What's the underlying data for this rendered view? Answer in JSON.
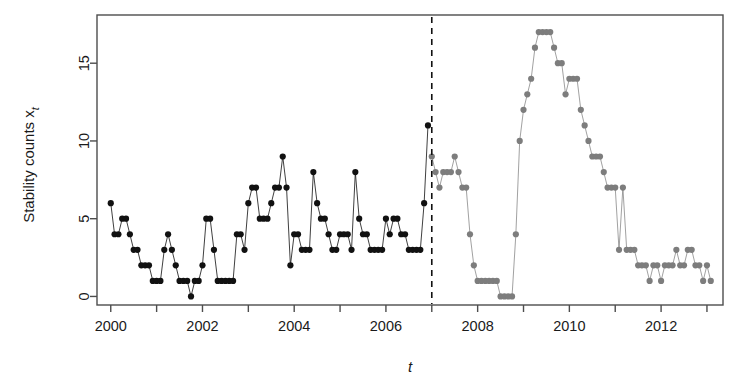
{
  "figure": {
    "background": "#ffffff",
    "frame_color": "#4d4d4d"
  },
  "axes": {
    "y_title_main": "Stability counts x",
    "y_title_sub": "t",
    "x_title": "t",
    "y_ticks": [
      0,
      5,
      10,
      15
    ],
    "x_ticks": [
      2000,
      2002,
      2004,
      2006,
      2008,
      2010,
      2012
    ],
    "x_minor_ticks": [
      2001,
      2003,
      2005,
      2007,
      2009,
      2011,
      2013
    ],
    "xlim": [
      1999.7,
      2013.35
    ],
    "ylim": [
      -0.55,
      18.1
    ]
  },
  "styles": {
    "observed_color": "#111111",
    "forecast_color": "#7d7d7d",
    "line_color_observed": "#111111",
    "line_color_forecast": "#8a8a8a",
    "divider_color": "#111111",
    "point_radius": 3.1
  },
  "chart_data": {
    "type": "scatter",
    "title": "",
    "xlabel": "t",
    "ylabel": "Stability counts x_t",
    "xlim": [
      1999.7,
      2013.35
    ],
    "ylim": [
      -0.55,
      18.1
    ],
    "grid": false,
    "legend": null,
    "annotations": [
      {
        "type": "vline",
        "x": 2007.0,
        "style": "dashed",
        "color": "#111111",
        "label": "segmentation between observed and forecast period"
      }
    ],
    "series": [
      {
        "name": "observed",
        "color": "#111111",
        "marker": "filled-circle",
        "connected": true,
        "x": [
          2000.0,
          2000.083,
          2000.167,
          2000.25,
          2000.333,
          2000.417,
          2000.5,
          2000.583,
          2000.667,
          2000.75,
          2000.833,
          2000.917,
          2001.0,
          2001.083,
          2001.167,
          2001.25,
          2001.333,
          2001.417,
          2001.5,
          2001.583,
          2001.667,
          2001.75,
          2001.833,
          2001.917,
          2002.0,
          2002.083,
          2002.167,
          2002.25,
          2002.333,
          2002.417,
          2002.5,
          2002.583,
          2002.667,
          2002.75,
          2002.833,
          2002.917,
          2003.0,
          2003.083,
          2003.167,
          2003.25,
          2003.333,
          2003.417,
          2003.5,
          2003.583,
          2003.667,
          2003.75,
          2003.833,
          2003.917,
          2004.0,
          2004.083,
          2004.167,
          2004.25,
          2004.333,
          2004.417,
          2004.5,
          2004.583,
          2004.667,
          2004.75,
          2004.833,
          2004.917,
          2005.0,
          2005.083,
          2005.167,
          2005.25,
          2005.333,
          2005.417,
          2005.5,
          2005.583,
          2005.667,
          2005.75,
          2005.833,
          2005.917,
          2006.0,
          2006.083,
          2006.167,
          2006.25,
          2006.333,
          2006.417,
          2006.5,
          2006.583,
          2006.667,
          2006.75,
          2006.833,
          2006.917
        ],
        "y": [
          6,
          4,
          4,
          5,
          5,
          4,
          3,
          3,
          2,
          2,
          2,
          1,
          1,
          1,
          3,
          4,
          3,
          2,
          1,
          1,
          1,
          0,
          1,
          1,
          2,
          5,
          5,
          3,
          1,
          1,
          1,
          1,
          1,
          4,
          4,
          3,
          6,
          7,
          7,
          5,
          5,
          5,
          6,
          7,
          7,
          9,
          7,
          2,
          4,
          4,
          3,
          3,
          3,
          8,
          6,
          5,
          5,
          4,
          3,
          3,
          4,
          4,
          4,
          3,
          8,
          5,
          4,
          4,
          3,
          3,
          3,
          3,
          5,
          4,
          5,
          5,
          4,
          4,
          3,
          3,
          3,
          3,
          6,
          11
        ],
        "note": "black filled circles, monthly observations Jan 2000 through Dec 2006"
      },
      {
        "name": "forecast",
        "color": "#7d7d7d",
        "marker": "filled-circle",
        "connected": true,
        "x": [
          2007.0,
          2007.083,
          2007.167,
          2007.25,
          2007.333,
          2007.417,
          2007.5,
          2007.583,
          2007.667,
          2007.75,
          2007.833,
          2007.917,
          2008.0,
          2008.083,
          2008.167,
          2008.25,
          2008.333,
          2008.417,
          2008.5,
          2008.583,
          2008.667,
          2008.75,
          2008.833,
          2008.917,
          2009.0,
          2009.083,
          2009.167,
          2009.25,
          2009.333,
          2009.417,
          2009.5,
          2009.583,
          2009.667,
          2009.75,
          2009.833,
          2009.917,
          2010.0,
          2010.083,
          2010.167,
          2010.25,
          2010.333,
          2010.417,
          2010.5,
          2010.583,
          2010.667,
          2010.75,
          2010.833,
          2010.917,
          2011.0,
          2011.083,
          2011.167,
          2011.25,
          2011.333,
          2011.417,
          2011.5,
          2011.583,
          2011.667,
          2011.75,
          2011.833,
          2011.917,
          2012.0,
          2012.083,
          2012.167,
          2012.25,
          2012.333,
          2012.417,
          2012.5,
          2012.583,
          2012.667,
          2012.75,
          2012.833,
          2012.917,
          2013.0,
          2013.083
        ],
        "y": [
          9,
          8,
          7,
          8,
          8,
          8,
          9,
          8,
          7,
          7,
          4,
          2,
          1,
          1,
          1,
          1,
          1,
          1,
          0,
          0,
          0,
          0,
          4,
          10,
          12,
          13,
          14,
          16,
          17,
          17,
          17,
          17,
          16,
          15,
          15,
          13,
          14,
          14,
          14,
          12,
          11,
          10,
          9,
          9,
          9,
          8,
          7,
          7,
          7,
          3,
          7,
          3,
          3,
          3,
          2,
          2,
          2,
          1,
          2,
          2,
          1,
          2,
          2,
          2,
          3,
          2,
          2,
          3,
          3,
          2,
          2,
          1,
          2,
          1
        ],
        "note": "gray filled circles, monthly values Jan 2007 onward, rising to a peak of 17 in mid-2009"
      }
    ]
  }
}
